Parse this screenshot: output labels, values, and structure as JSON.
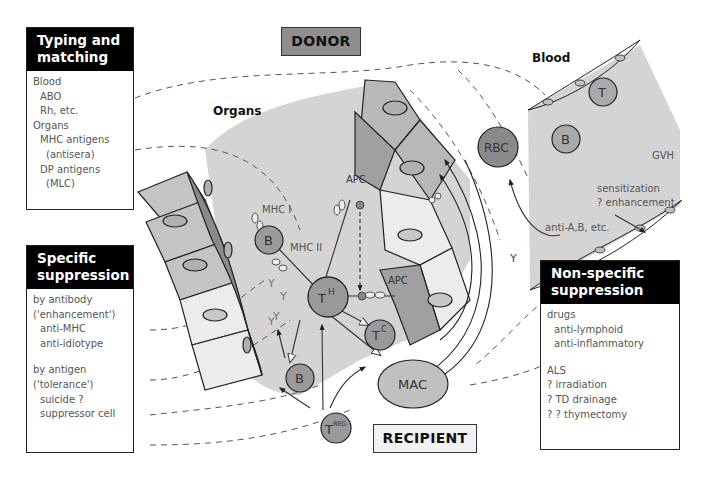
{
  "labels": {
    "donor": "DONOR",
    "recipient": "RECIPIENT",
    "organs": "Organs",
    "blood": "Blood"
  },
  "panels": {
    "typing": {
      "title_line1": "Typing and",
      "title_line2": "matching",
      "items": [
        {
          "text": "Blood",
          "indent": 0
        },
        {
          "text": "ABO",
          "indent": 1
        },
        {
          "text": "Rh, etc.",
          "indent": 1
        },
        {
          "text": "Organs",
          "indent": 0
        },
        {
          "text": "MHC antigens",
          "indent": 1
        },
        {
          "text": "(antisera)",
          "indent": 2
        },
        {
          "text": "DP antigens",
          "indent": 1
        },
        {
          "text": "(MLC)",
          "indent": 2
        }
      ]
    },
    "specific": {
      "title_line1": "Specific",
      "title_line2": "suppression",
      "items": [
        {
          "text": "by antibody",
          "indent": 0
        },
        {
          "text": "('enhancement')",
          "indent": 0
        },
        {
          "text": "anti-MHC",
          "indent": 1
        },
        {
          "text": "anti-idiotype",
          "indent": 1
        },
        {
          "text": "",
          "indent": -1
        },
        {
          "text": "by antigen",
          "indent": 0
        },
        {
          "text": "('tolerance')",
          "indent": 0
        },
        {
          "text": "suicide ?",
          "indent": 1
        },
        {
          "text": "suppressor cell",
          "indent": 1
        }
      ]
    },
    "nonspecific": {
      "title_line1": "Non-specific",
      "title_line2": "suppression",
      "items": [
        {
          "text": "drugs",
          "indent": 0
        },
        {
          "text": "anti-lymphoid",
          "indent": 1
        },
        {
          "text": "anti-inflammatory",
          "indent": 1
        },
        {
          "text": "",
          "indent": -1
        },
        {
          "text": "ALS",
          "indent": 0
        },
        {
          "text": "? irradiation",
          "indent": 0
        },
        {
          "text": "? TD drainage",
          "indent": 0
        },
        {
          "text": "? ? thymectomy",
          "indent": 0
        }
      ]
    }
  },
  "cells": {
    "th": {
      "main": "T",
      "sup": "H"
    },
    "tc": {
      "main": "T",
      "sup": "C"
    },
    "treg": {
      "main": "T",
      "sup": "REG"
    },
    "b_organ_top": "B",
    "b_organ_bottom": "B",
    "apc_top": "APC",
    "apc_bottom": "APC",
    "mac": "MAC",
    "rbc": "RBC",
    "t_blood": "T",
    "b_blood": "B"
  },
  "annotations": {
    "mhc1": "MHC I",
    "mhc2": "MHC II",
    "gvh": "GVH",
    "sensitization": "sensitization",
    "enhancement": "? enhancement",
    "anti_ab": "anti-A,B, etc."
  },
  "colors": {
    "panel_header": "#000000",
    "donor_box": "#8e8e8e",
    "recipient_box": "#f2f2f2",
    "tissue_bg": "#d4d4d4",
    "cell_fill": "#9a9a9a",
    "epithelium_dark": "#b8b8b8",
    "epithelium_light": "#e6e6e6"
  }
}
